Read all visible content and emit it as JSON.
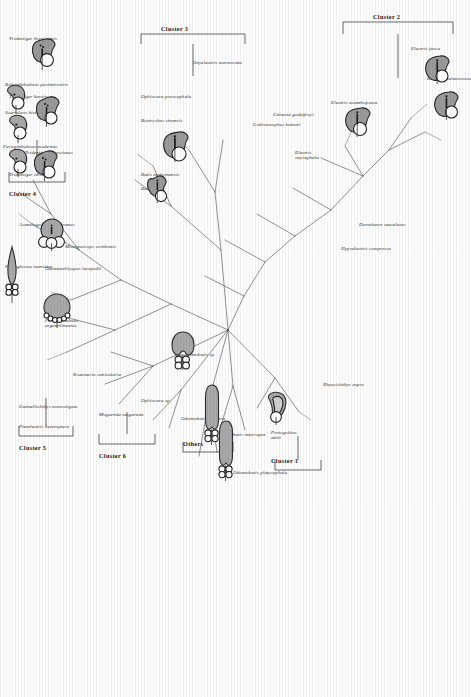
{
  "figure": {
    "type": "unrooted-phylogenetic-tree",
    "orientation_deg": 90,
    "background": "#ffffff",
    "line_color": "#3a3a3a",
    "fill_gray": "#a8a8a8",
    "fill_white": "#ffffff"
  },
  "clusters": [
    {
      "id": "c1",
      "label": "Cluster 1"
    },
    {
      "id": "c2",
      "label": "Cluster 2"
    },
    {
      "id": "c3",
      "label": "Cluster 3"
    },
    {
      "id": "c4",
      "label": "Cluster 4"
    },
    {
      "id": "c5",
      "label": "Cluster 5"
    },
    {
      "id": "c6",
      "label": "Cluster 6"
    },
    {
      "id": "others",
      "label": "Others"
    }
  ],
  "taxa": [
    {
      "id": "t01",
      "name": "Eleotris melanosoma",
      "cluster": "c2"
    },
    {
      "id": "t02",
      "name": "Eleotris fusca",
      "cluster": "c2"
    },
    {
      "id": "t03",
      "name": "Eleotris acanthopoma",
      "cluster": "c2"
    },
    {
      "id": "t04",
      "name": "Eleotris oxycephala",
      "cluster": "c2"
    },
    {
      "id": "t05",
      "name": "Calumia godeffroyi",
      "cluster": "c2"
    },
    {
      "id": "t06",
      "name": "Gobiomorphus huttoni",
      "cluster": "c2"
    },
    {
      "id": "t07",
      "name": "Dormitator maculatus",
      "cluster": "c2"
    },
    {
      "id": "t08",
      "name": "Hypseleotris compressa",
      "cluster": "c2"
    },
    {
      "id": "t09",
      "name": "Rhyacichthys aspro",
      "cluster": "c1"
    },
    {
      "id": "t10",
      "name": "Protogobius attiti",
      "cluster": "c1"
    },
    {
      "id": "t11",
      "name": "Neoodontobutis sp.",
      "cluster": "others"
    },
    {
      "id": "t12",
      "name": "Odontobutis obscura",
      "cluster": "others"
    },
    {
      "id": "t13",
      "name": "Odontobutis interrupta",
      "cluster": "others"
    },
    {
      "id": "t14",
      "name": "Odontobutis platycephala",
      "cluster": "others"
    },
    {
      "id": "t15",
      "name": "Ophiocara sp.",
      "cluster": "c6"
    },
    {
      "id": "t16",
      "name": "Mogurnda mogurnda",
      "cluster": "c6"
    },
    {
      "id": "t17",
      "name": "Kraemeria cunicularia",
      "cluster": "c5"
    },
    {
      "id": "t18",
      "name": "Gunnellichthys monostigma",
      "cluster": "c5"
    },
    {
      "id": "t19",
      "name": "Ptereleotris heteroptera",
      "cluster": "c5"
    },
    {
      "id": "t20",
      "name": "Micropercops swinhonis",
      "cluster": "c4"
    },
    {
      "id": "t21",
      "name": "Odontamblyopus lacepedii",
      "cluster": "c4"
    },
    {
      "id": "t22",
      "name": "Periophthalmus argentilineatus",
      "cluster": "c4"
    },
    {
      "id": "t23",
      "name": "Acanthogobius flavimanus",
      "cluster": "c4"
    },
    {
      "id": "t24",
      "name": "Tridentiger bifasciatus",
      "cluster": "c4"
    },
    {
      "id": "t25",
      "name": "Tridentiger obscurus",
      "cluster": "c4"
    },
    {
      "id": "t26",
      "name": "Tridentiger kuroiwae",
      "cluster": "c4"
    },
    {
      "id": "t27",
      "name": "Tridentiger brevispinis",
      "cluster": "c4"
    },
    {
      "id": "t28",
      "name": "Boleophthalmus pectinirostris",
      "cluster": "c4"
    },
    {
      "id": "t29",
      "name": "Scartelaos histophorus",
      "cluster": "c4"
    },
    {
      "id": "t30",
      "name": "Periophthalmus modestus",
      "cluster": "c4"
    },
    {
      "id": "t31",
      "name": "Parioglossus taeniatus",
      "cluster": "c4"
    },
    {
      "id": "t32",
      "name": "Bostrychus sinensis",
      "cluster": "c3"
    },
    {
      "id": "t33",
      "name": "Butis amboinensis",
      "cluster": "c3"
    },
    {
      "id": "t34",
      "name": "Butis butis",
      "cluster": "c3"
    },
    {
      "id": "t35",
      "name": "Ophiocara porocephala",
      "cluster": "c3"
    },
    {
      "id": "t36",
      "name": "Oxyeleotris marmorata",
      "cluster": "c3"
    }
  ]
}
